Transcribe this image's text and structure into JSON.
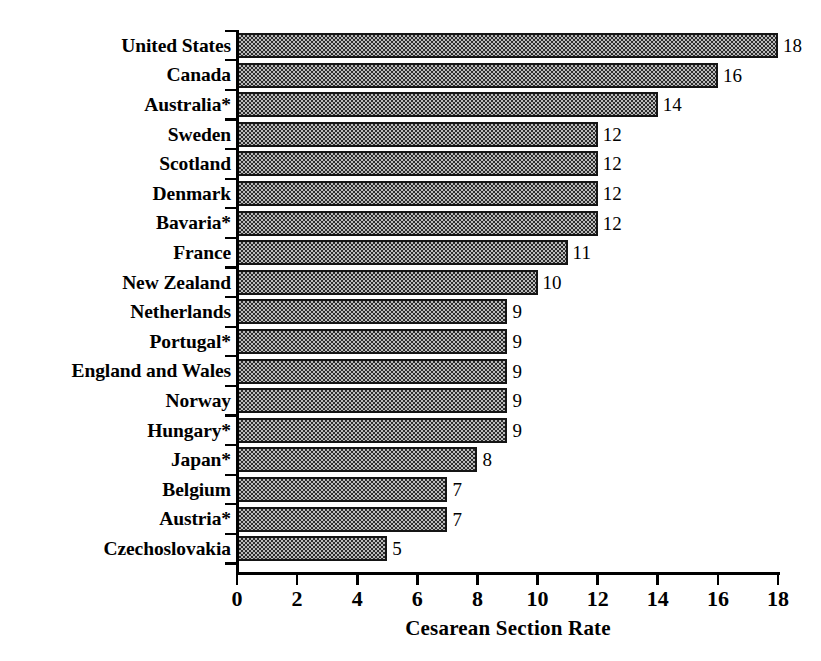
{
  "chart_data": {
    "type": "bar",
    "orientation": "horizontal",
    "title": "",
    "xlabel": "Cesarean Section Rate",
    "ylabel": "",
    "xlim": [
      0,
      18
    ],
    "xticks": [
      0,
      2,
      4,
      6,
      8,
      10,
      12,
      14,
      16,
      18
    ],
    "xtick_labels": [
      "0",
      "2",
      "4",
      "6",
      "8",
      "10",
      "12",
      "14",
      "16",
      "18"
    ],
    "grid": false,
    "legend": null,
    "value_labels": true,
    "categories": [
      "United States",
      "Canada",
      "Australia*",
      "Sweden",
      "Scotland",
      "Denmark",
      "Bavaria*",
      "France",
      "New Zealand",
      "Netherlands",
      "Portugal*",
      "England and Wales",
      "Norway",
      "Hungary*",
      "Japan*",
      "Belgium",
      "Austria*",
      "Czechoslovakia"
    ],
    "values": [
      18,
      16,
      14,
      12,
      12,
      12,
      12,
      11,
      10,
      9,
      9,
      9,
      9,
      9,
      8,
      7,
      7,
      5
    ],
    "value_label_texts": [
      "18",
      "16",
      "14",
      "12",
      "12",
      "12",
      "12",
      "11",
      "10",
      "9",
      "9",
      "9",
      "9",
      "9",
      "8",
      "7",
      "7",
      "5"
    ],
    "bar_fill": "#b9b9b9",
    "bar_pattern": "checkerboard-dither",
    "bar_border_color": "#151515",
    "axis_color": "#000000",
    "background": "#ffffff"
  }
}
